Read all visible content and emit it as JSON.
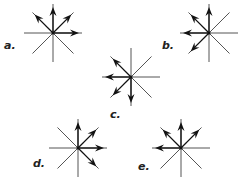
{
  "diagram": {
    "line_color": "#555555",
    "arrow_color": "#111111",
    "stars": [
      {
        "label": "a.",
        "cx": 53,
        "cy": 33,
        "arrows": [
          "up",
          "up-left",
          "up-right",
          "right"
        ],
        "label_x": 4,
        "label_y": 39
      },
      {
        "label": "b.",
        "cx": 209,
        "cy": 33,
        "arrows": [
          "up",
          "up-left",
          "left",
          "down-left"
        ],
        "label_x": 162,
        "label_y": 39
      },
      {
        "label": "c.",
        "cx": 131,
        "cy": 77,
        "arrows": [
          "up-left",
          "left",
          "down-left",
          "down"
        ],
        "label_x": 110,
        "label_y": 108
      },
      {
        "label": "d.",
        "cx": 78,
        "cy": 148,
        "arrows": [
          "up",
          "up-right",
          "right",
          "down-right"
        ],
        "label_x": 33,
        "label_y": 157
      },
      {
        "label": "e.",
        "cx": 181,
        "cy": 148,
        "arrows": [
          "up",
          "up-left",
          "up-right",
          "left"
        ],
        "label_x": 138,
        "label_y": 160
      }
    ]
  }
}
